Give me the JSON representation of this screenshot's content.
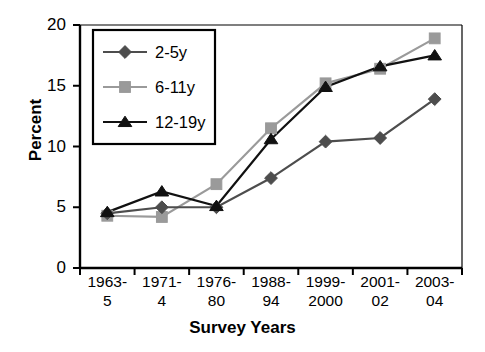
{
  "chart_data": {
    "type": "line",
    "title": "",
    "xlabel": "Survey Years",
    "ylabel": "Percent",
    "categories": [
      "1963-5",
      "1971-4",
      "1976-80",
      "1988-94",
      "1999-2000",
      "2001-02",
      "2003-04"
    ],
    "category_lines": [
      [
        "1963-",
        "5"
      ],
      [
        "1971-",
        "4"
      ],
      [
        "1976-",
        "80"
      ],
      [
        "1988-",
        "94"
      ],
      [
        "1999-",
        "2000"
      ],
      [
        "2001-",
        "02"
      ],
      [
        "2003-",
        "04"
      ]
    ],
    "ylim": [
      0,
      20
    ],
    "yticks": [
      0,
      5,
      10,
      15,
      20
    ],
    "ytick_labels": [
      "0",
      "5",
      "10",
      "15",
      "20"
    ],
    "grid": false,
    "legend_position": "upper-left-inside",
    "series": [
      {
        "name": "2-5y",
        "marker": "diamond",
        "color": "#4d4d4d",
        "values": [
          4.5,
          5.0,
          5.0,
          7.4,
          10.4,
          10.7,
          13.9
        ]
      },
      {
        "name": "6-11y",
        "marker": "square",
        "color": "#9a9a9a",
        "values": [
          4.3,
          4.2,
          6.9,
          11.5,
          15.2,
          16.4,
          18.9
        ]
      },
      {
        "name": "12-19y",
        "marker": "triangle",
        "color": "#111111",
        "values": [
          4.6,
          6.3,
          5.1,
          10.6,
          14.9,
          16.6,
          17.5
        ]
      }
    ]
  }
}
